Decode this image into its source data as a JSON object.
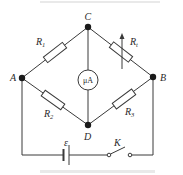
{
  "diagram": {
    "type": "wheatstone-bridge-circuit",
    "nodes": {
      "A": {
        "label": "A"
      },
      "B": {
        "label": "B"
      },
      "C": {
        "label": "C"
      },
      "D": {
        "label": "D"
      }
    },
    "components": {
      "R1": {
        "label": "R",
        "sub": "1",
        "between": "A-C"
      },
      "Rt": {
        "label": "R",
        "sub": "t",
        "between": "C-B",
        "variable": true
      },
      "R2": {
        "label": "R",
        "sub": "2",
        "between": "A-D"
      },
      "R3": {
        "label": "R",
        "sub": "3",
        "between": "D-B"
      },
      "meter": {
        "label": "μA",
        "between": "C-D"
      },
      "battery": {
        "label": "ε"
      },
      "switch": {
        "label": "K"
      }
    }
  },
  "colors": {
    "line": "#3a3a3a",
    "node": "#1a1a1a",
    "background": "#ffffff"
  }
}
